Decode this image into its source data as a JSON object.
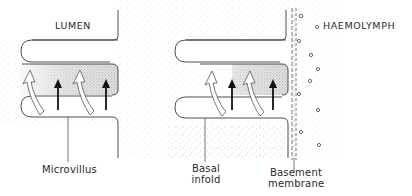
{
  "diagram": {
    "type": "cell cross-section schematic",
    "regions": {
      "lumen": "LUMEN",
      "haemolymph": "HAEMOLYMPH"
    },
    "labels": {
      "microvillus": "Microvillus",
      "basal_infold_line1": "Basal",
      "basal_infold_line2": "infold",
      "basement_membrane_line1": "Basement",
      "basement_membrane_line2": "membrane"
    },
    "arrow_legend": {
      "hollow_curved_arrow": "white curved flow arrow",
      "solid_arrow": "black straight arrow"
    },
    "colors": {
      "line": "#3a3a3a",
      "stipple_light": "#c8c8c8",
      "stipple_dark": "#8a8a8a",
      "background": "#ffffff",
      "solid_arrow": "#111111"
    }
  }
}
